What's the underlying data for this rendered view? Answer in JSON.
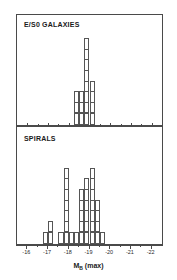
{
  "figure": {
    "axis_title_main": "M",
    "axis_title_sub": "B",
    "axis_title_suffix": " (max)"
  },
  "panels": [
    {
      "id": "eso",
      "label": "E/S0 GALAXIES"
    },
    {
      "id": "spirals",
      "label": "SPIRALS"
    }
  ],
  "axis": {
    "tick_labels": [
      "-16",
      "-17",
      "-18",
      "-19",
      "-20",
      "-21",
      "-22"
    ],
    "tick_values": [
      -16,
      -17,
      -18,
      -19,
      -20,
      -21,
      -22
    ]
  },
  "chart_data": {
    "type": "bar",
    "title": "",
    "subtitle": "",
    "xlabel": "M_B (max)",
    "ylabel": "",
    "xlim": [
      -15.5,
      -22.5
    ],
    "grid": false,
    "legend": "none",
    "bin_width": 0.25,
    "panels": [
      {
        "name": "E/S0 GALAXIES",
        "categories": [
          -18.25,
          -18.5,
          -18.75,
          -19.0
        ],
        "values": [
          3,
          3,
          8,
          4
        ],
        "ylim": [
          0,
          8
        ]
      },
      {
        "name": "SPIRALS",
        "categories": [
          -16.75,
          -17.0,
          -17.5,
          -17.75,
          -18.0,
          -18.25,
          -18.5,
          -18.75,
          -19.0,
          -19.25,
          -19.5
        ],
        "values": [
          1,
          2,
          1,
          7,
          1,
          1,
          5,
          6,
          7,
          4,
          1
        ],
        "ylim": [
          0,
          7
        ]
      }
    ]
  }
}
